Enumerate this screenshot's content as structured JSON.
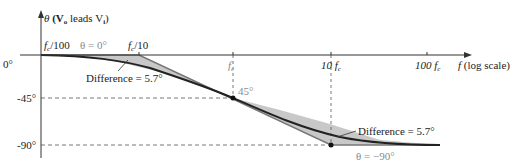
{
  "diagram": {
    "y_axis": {
      "label_symbol": "θ",
      "label_text": "(V",
      "label_sub1": "o",
      "label_mid": " leads V",
      "label_sub2": "i",
      "label_end": ")",
      "ticks": [
        "0°",
        "-45°",
        "-90°"
      ]
    },
    "x_axis": {
      "label_f": "f",
      "label_rest": " (log scale)",
      "ticks": [
        {
          "pre": "f",
          "sub": "c",
          "post": "/100"
        },
        {
          "pre": "f",
          "sub": "c",
          "post": "/10"
        },
        {
          "pre": "f",
          "sub": "c",
          "post": ""
        },
        {
          "pre": "10 f",
          "sub": "c",
          "post": ""
        },
        {
          "pre": "100 f",
          "sub": "c",
          "post": ""
        }
      ]
    },
    "annotations": {
      "theta_zero": "θ = 0°",
      "point_45": "45°",
      "difference_1": "Difference = 5.7°",
      "difference_2": "Difference = 5.7°",
      "theta_minus90": "θ = −90°"
    },
    "colors": {
      "axis": "#333333",
      "curve": "#222222",
      "fill": "#c8c8c8",
      "asymptote": "#777777",
      "gray_text": "#8a8a8a"
    }
  }
}
